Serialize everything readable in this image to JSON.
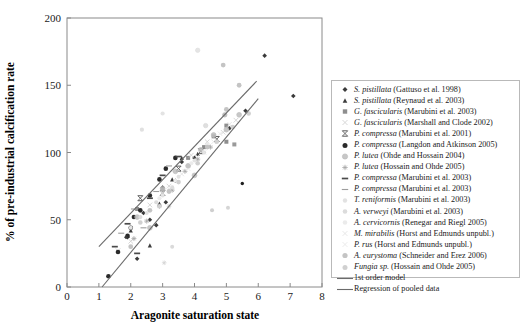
{
  "chart_data": {
    "type": "scatter",
    "title": "",
    "xlabel": "Aragonite saturation state",
    "ylabel": "% of pre-industrial calcification rate",
    "xlim": [
      0,
      8
    ],
    "ylim": [
      0,
      200
    ],
    "xticks": [
      0,
      1,
      2,
      3,
      4,
      5,
      6,
      7,
      8
    ],
    "yticks": [
      0,
      50,
      100,
      150,
      200
    ],
    "grid": false,
    "legend_position": "right-outside",
    "series": [
      {
        "name": "S. pistillata (Gattuso et al. 1998)",
        "species": "S. pistillata",
        "reference": "(Gattuso et al. 1998)",
        "marker": "diamond",
        "color": "#3a3a3a",
        "size": 4.6,
        "points": [
          [
            1.9,
            37
          ],
          [
            2.4,
            55
          ],
          [
            2.6,
            50
          ],
          [
            3.0,
            74
          ],
          [
            3.1,
            63
          ],
          [
            3.4,
            79
          ],
          [
            3.6,
            93
          ],
          [
            4.0,
            96
          ],
          [
            4.4,
            105
          ],
          [
            5.1,
            118
          ],
          [
            5.6,
            131
          ],
          [
            6.2,
            172
          ],
          [
            7.1,
            142
          ],
          [
            2.2,
            21
          ],
          [
            2.8,
            46
          ]
        ]
      },
      {
        "name": "S. pistillata (Reynaud et al. 2003)",
        "species": "S. pistillata",
        "reference": "(Reynaud et al. 2003)",
        "marker": "triangle",
        "color": "#3c3c3c",
        "size": 4.2,
        "points": [
          [
            2.0,
            42
          ],
          [
            2.6,
            31
          ],
          [
            3.3,
            80
          ],
          [
            3.6,
            96
          ],
          [
            4.1,
            99
          ],
          [
            2.9,
            62
          ]
        ]
      },
      {
        "name": "G. fascicularis (Marubini et al. 2003)",
        "species": "G. fascicularis",
        "reference": "(Marubini et al. 2003)",
        "marker": "square",
        "color": "#8e8e8e",
        "size": 4.0,
        "points": [
          [
            2.2,
            58
          ],
          [
            3.0,
            72
          ],
          [
            3.8,
            96
          ],
          [
            4.3,
            104
          ],
          [
            4.6,
            112
          ],
          [
            5.0,
            120
          ]
        ]
      },
      {
        "name": "G. fascicularis (Marshall and Clode 2002)",
        "species": "G. fascicularis",
        "reference": "(Marshall and Clode 2002)",
        "marker": "cross-x",
        "color": "#d3d3d3",
        "size": 4.6,
        "points": [
          [
            1.6,
            27
          ],
          [
            2.0,
            34
          ],
          [
            2.6,
            61
          ],
          [
            3.2,
            75
          ],
          [
            3.9,
            98
          ],
          [
            4.4,
            108
          ],
          [
            4.9,
            115
          ],
          [
            5.3,
            124
          ]
        ]
      },
      {
        "name": "P. compressa (Marubini et al. 2001)",
        "species": "P. compressa",
        "reference": "(Marubini et al. 2001)",
        "marker": "bar-x",
        "color": "#5a5a5a",
        "size": 5.0,
        "points": [
          [
            2.3,
            66
          ],
          [
            3.0,
            70
          ],
          [
            3.5,
            88
          ],
          [
            4.2,
            101
          ],
          [
            4.7,
            110
          ]
        ]
      },
      {
        "name": "P. compressa (Langdon and Atkinson 2005)",
        "species": "P. compressa",
        "reference": "(Langdon and Atkinson 2005)",
        "marker": "circle",
        "color": "#2a2a2a",
        "size": 4.6,
        "points": [
          [
            1.3,
            8
          ],
          [
            1.6,
            26
          ],
          [
            1.9,
            38
          ],
          [
            2.0,
            44
          ],
          [
            2.3,
            57
          ],
          [
            2.6,
            68
          ],
          [
            2.9,
            80
          ],
          [
            3.1,
            88
          ],
          [
            3.4,
            96
          ],
          [
            2.1,
            52
          ]
        ]
      },
      {
        "name": "P. lutea (Ohde and Hossain 2004)",
        "species": "P. lutea",
        "reference": "(Ohde and Hossain 2004)",
        "marker": "circle-open",
        "color": "#bdbdbd",
        "size": 4.8,
        "points": [
          [
            2.2,
            52
          ],
          [
            2.6,
            44
          ],
          [
            3.0,
            73
          ],
          [
            3.4,
            86
          ],
          [
            3.8,
            90
          ],
          [
            4.2,
            102
          ],
          [
            4.6,
            113
          ],
          [
            5.0,
            117
          ],
          [
            5.4,
            128
          ],
          [
            4.0,
            83
          ]
        ]
      },
      {
        "name": "P. lutea (Hossain and Ohde 2005)",
        "species": "P. lutea",
        "reference": "(Hossain and Ohde 2005)",
        "marker": "star",
        "color": "#a6a6a6",
        "size": 5.0,
        "points": [
          [
            2.1,
            36
          ],
          [
            2.5,
            49
          ],
          [
            2.9,
            60
          ],
          [
            3.3,
            72
          ],
          [
            3.7,
            86
          ],
          [
            4.1,
            95
          ],
          [
            4.5,
            104
          ]
        ]
      },
      {
        "name": "P. compressa (Marubini et al. 2003)",
        "species": "P. compressa",
        "reference": "(Marubini et al. 2003)",
        "marker": "dash-bold",
        "color": "#4a4a4a",
        "size": 6.0,
        "points": [
          [
            1.5,
            30
          ],
          [
            1.9,
            47
          ],
          [
            2.2,
            25
          ],
          [
            2.6,
            66
          ],
          [
            3.0,
            83
          ],
          [
            3.5,
            97
          ]
        ]
      },
      {
        "name": "P. compressa (Marubini et al. 2003)",
        "species": "P. compressa",
        "reference": "(Marubini et al. 2003)",
        "marker": "dash-light",
        "color": "#9d9d9d",
        "size": 6.0,
        "points": [
          [
            1.7,
            40
          ],
          [
            2.1,
            58
          ],
          [
            2.4,
            44
          ],
          [
            2.8,
            71
          ],
          [
            3.2,
            90
          ]
        ]
      },
      {
        "name": "T. reniformis (Marubini et al. 2003)",
        "species": "T. reniformis",
        "reference": "(Marubini et al. 2003)",
        "marker": "dot-faint",
        "color": "#e2e2e2",
        "size": 4.0,
        "points": [
          [
            2.0,
            44
          ],
          [
            2.5,
            55
          ],
          [
            3.0,
            68
          ],
          [
            3.5,
            82
          ],
          [
            4.0,
            94
          ]
        ]
      },
      {
        "name": "A. verweyi (Marubini et al. 2003)",
        "species": "A. verweyi",
        "reference": "(Marubini et al. 2003)",
        "marker": "dot-faint2",
        "color": "#dcdcdc",
        "size": 4.2,
        "points": [
          [
            2.3,
            52
          ],
          [
            2.8,
            63
          ],
          [
            3.3,
            74
          ],
          [
            3.8,
            90
          ],
          [
            4.3,
            100
          ]
        ]
      },
      {
        "name": "A. cervicornis (Renegar and Riegl 2005)",
        "species": "A. cervicornis",
        "reference": "(Renegar and Riegl 2005)",
        "marker": "dot-faint3",
        "color": "#ebebeb",
        "size": 4.2,
        "points": [
          [
            2.9,
            66
          ],
          [
            3.4,
            79
          ],
          [
            3.9,
            92
          ],
          [
            4.4,
            106
          ]
        ]
      },
      {
        "name": "M. mirabilis (Horst and Edmunds unpubl.)",
        "species": "M. mirabilis",
        "reference": "(Horst and Edmunds unpubl.)",
        "marker": "cross-faint",
        "color": "#e4e4e4",
        "size": 4.4,
        "points": [
          [
            3.0,
            70
          ],
          [
            3.6,
            84
          ],
          [
            4.1,
            97
          ],
          [
            4.6,
            108
          ],
          [
            5.1,
            121
          ]
        ]
      },
      {
        "name": "P. rus (Horst and Edmunds unpubl.)",
        "species": "P. rus",
        "reference": "(Horst and Edmunds unpubl.)",
        "marker": "cross-faint2",
        "color": "#e8e8e8",
        "size": 4.4,
        "points": [
          [
            3.2,
            73
          ],
          [
            3.8,
            88
          ],
          [
            4.3,
            100
          ],
          [
            4.8,
            114
          ]
        ]
      },
      {
        "name": "A. eurystoma (Schneider and Erez 2006)",
        "species": "A. eurystoma",
        "reference": "(Schneider and Erez 2006)",
        "marker": "circle-gray",
        "color": "#c4c4c4",
        "size": 4.8,
        "points": [
          [
            2.0,
            30
          ],
          [
            2.6,
            57
          ],
          [
            3.2,
            71
          ],
          [
            3.8,
            90
          ],
          [
            4.4,
            104
          ],
          [
            5.0,
            132
          ],
          [
            5.4,
            150
          ],
          [
            4.9,
            165
          ]
        ]
      },
      {
        "name": "Fungia sp. (Hossain and Ohde 2005)",
        "species": "Fungia sp.",
        "reference": "(Hossain and Ohde 2005)",
        "marker": "circle-lgray",
        "color": "#d0d0d0",
        "size": 4.6,
        "points": [
          [
            2.3,
            48
          ],
          [
            2.9,
            60
          ],
          [
            3.5,
            78
          ],
          [
            4.1,
            92
          ],
          [
            4.7,
            108
          ],
          [
            5.2,
            119
          ],
          [
            5.7,
            129
          ]
        ]
      }
    ],
    "lines": [
      {
        "name": "1st order model",
        "label": "1st order model",
        "style": "solid",
        "color": "#6b6b6b",
        "p1": [
          1.0,
          30
        ],
        "p2": [
          5.95,
          153
        ]
      },
      {
        "name": "Regression of pooled data",
        "label": "Regression of pooled data",
        "style": "solid",
        "color": "#6b6b6b",
        "p1": [
          1.1,
          0
        ],
        "p2": [
          6.0,
          140
        ]
      }
    ],
    "scatter_points_extra": [
      {
        "x": 1.85,
        "y": 37,
        "color": "#3a3a3a",
        "marker": "diamond",
        "size": 4.0
      },
      {
        "x": 5.0,
        "y": 108,
        "color": "#8e8e8e",
        "marker": "square",
        "size": 4.0
      },
      {
        "x": 5.25,
        "y": 106,
        "color": "#9a9a9a",
        "marker": "square",
        "size": 4.0
      },
      {
        "x": 4.35,
        "y": 120,
        "color": "#d9d9d9",
        "marker": "circle-open",
        "size": 4.4
      },
      {
        "x": 4.1,
        "y": 176,
        "color": "#e0e0e0",
        "marker": "circle-open",
        "size": 4.4
      },
      {
        "x": 4.95,
        "y": 128,
        "color": "#b4b4b4",
        "marker": "circle-open",
        "size": 4.4
      },
      {
        "x": 5.5,
        "y": 77,
        "color": "#1f1f1f",
        "marker": "circle",
        "size": 3.4
      },
      {
        "x": 4.55,
        "y": 57,
        "color": "#cfcfcf",
        "marker": "dot-faint",
        "size": 4.0
      },
      {
        "x": 5.05,
        "y": 59,
        "color": "#d5d5d5",
        "marker": "dot-faint",
        "size": 4.0
      },
      {
        "x": 3.3,
        "y": 30,
        "color": "#dadada",
        "marker": "dot-faint",
        "size": 4.0
      },
      {
        "x": 2.35,
        "y": 117,
        "color": "#e0e0e0",
        "marker": "dot-faint",
        "size": 4.2
      },
      {
        "x": 3.0,
        "y": 129,
        "color": "#e3e3e3",
        "marker": "dot-faint",
        "size": 4.2
      },
      {
        "x": 3.2,
        "y": 60,
        "color": "#cacaca",
        "marker": "star",
        "size": 4.6
      },
      {
        "x": 3.05,
        "y": 18,
        "color": "#d4d4d4",
        "marker": "star",
        "size": 4.6
      }
    ]
  }
}
